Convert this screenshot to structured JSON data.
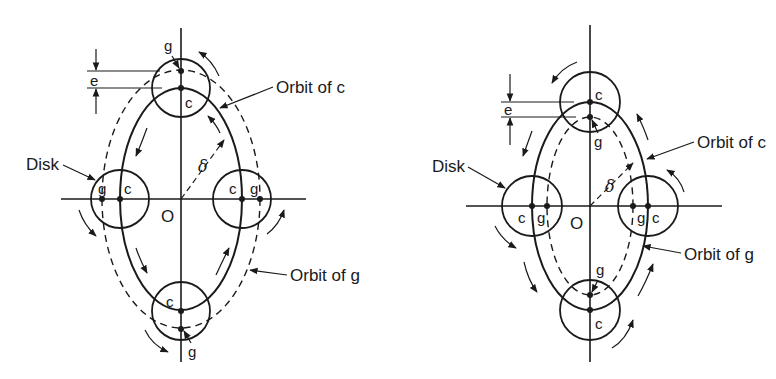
{
  "diagrams": [
    {
      "id": "left",
      "labels": {
        "disk": "Disk",
        "orbit_c": "Orbit of c",
        "orbit_g": "Orbit of g",
        "origin": "O",
        "delta": "δ",
        "eccentricity": "e",
        "center_point": "c",
        "gravity_point": "g"
      },
      "note": "g outside c (orbit of g larger than orbit of c)"
    },
    {
      "id": "right",
      "labels": {
        "disk": "Disk",
        "orbit_c": "Orbit of c",
        "orbit_g": "Orbit of g",
        "origin": "O",
        "delta": "δ",
        "eccentricity": "e",
        "center_point": "c",
        "gravity_point": "g"
      },
      "note": "g inside c (orbit of g smaller than orbit of c)"
    }
  ],
  "colors": {
    "ink": "#1a1a1a",
    "background": "#ffffff"
  }
}
